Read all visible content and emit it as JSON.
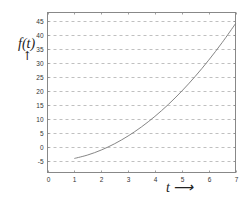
{
  "chart_data": {
    "type": "line",
    "title": "",
    "xlabel": "t",
    "xlabel_suffix": "⟶",
    "ylabel": "f(t)",
    "ylabel_suffix": "↑",
    "xlim": [
      0,
      7
    ],
    "ylim": [
      -9,
      48
    ],
    "xticks": [
      0,
      1,
      2,
      3,
      4,
      5,
      6,
      7
    ],
    "yticks": [
      -5,
      0,
      5,
      10,
      15,
      20,
      25,
      30,
      35,
      40,
      45
    ],
    "grid": {
      "x": false,
      "y": true,
      "style": "dashed"
    },
    "legend": null,
    "series": [
      {
        "name": "f(t)",
        "color": "#777777",
        "x": [
          1,
          1.5,
          2,
          2.5,
          3,
          3.5,
          4,
          4.5,
          5,
          5.5,
          6,
          6.5,
          7
        ],
        "values": [
          -4,
          -2.75,
          -1,
          1.25,
          4,
          7.25,
          11,
          15.25,
          20,
          25.25,
          31,
          37.25,
          44
        ]
      }
    ]
  },
  "labels": {
    "xlabel": "t ⟶",
    "ylabel": "f(t)",
    "yarrow": "↑"
  },
  "colors": {
    "axis": "#888888",
    "grid": "#b0b0b0",
    "line": "#777777"
  }
}
